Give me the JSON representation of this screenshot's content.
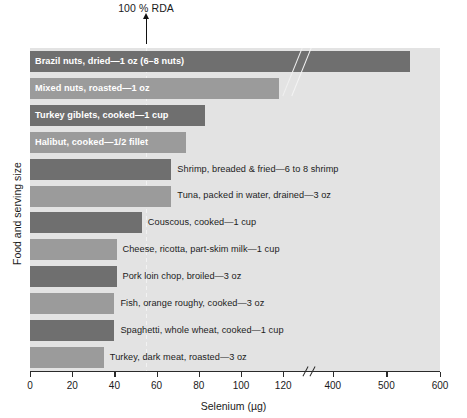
{
  "chart_data": {
    "type": "bar",
    "title": "",
    "xlabel": "Selenium (µg)",
    "ylabel": "Food and serving size",
    "orientation": "horizontal",
    "grid": false,
    "legend": "none",
    "axis_break": {
      "present": true,
      "between": [
        130,
        350
      ]
    },
    "xticks": [
      0,
      20,
      40,
      60,
      80,
      100,
      120,
      400,
      500,
      600
    ],
    "xtick_labels": [
      "0",
      "20",
      "40",
      "60",
      "80",
      "100",
      "120",
      "400",
      "500",
      "600"
    ],
    "xlim": [
      0,
      600
    ],
    "reference_line": {
      "label": "100 % RDA",
      "value": 55
    },
    "categories": [
      "Brazil nuts, dried—1 oz (6–8 nuts)",
      "Mixed nuts, roasted—1 oz",
      "Turkey giblets, cooked—1 cup",
      "Halibut, cooked—1/2 fillet",
      "Shrimp, breaded & fried—6 to 8 shrimp",
      "Tuna, packed in water, drained—3 oz",
      "Couscous, cooked—1 cup",
      "Cheese, ricotta, part-skim milk—1 cup",
      "Pork loin chop, broiled—3 oz",
      "Fish, orange roughy, cooked—3 oz",
      "Spaghetti, whole wheat, cooked—1 cup",
      "Turkey, dark meat, roasted—3 oz"
    ],
    "values": [
      544,
      118,
      83,
      74,
      67,
      67,
      53,
      41,
      41,
      40,
      40,
      35
    ]
  },
  "bars": [
    {
      "label": "Brazil nuts, dried—1 oz (6–8 nuts)",
      "value": 544,
      "shade": "dark",
      "label_position": "inside"
    },
    {
      "label": "Mixed nuts, roasted—1 oz",
      "value": 118,
      "shade": "light",
      "label_position": "inside"
    },
    {
      "label": "Turkey giblets, cooked—1 cup",
      "value": 83,
      "shade": "dark",
      "label_position": "inside"
    },
    {
      "label": "Halibut, cooked—1/2 fillet",
      "value": 74,
      "shade": "light",
      "label_position": "inside"
    },
    {
      "label": "Shrimp, breaded & fried—6 to 8 shrimp",
      "value": 67,
      "shade": "dark",
      "label_position": "outside"
    },
    {
      "label": "Tuna, packed in water, drained—3 oz",
      "value": 67,
      "shade": "light",
      "label_position": "outside"
    },
    {
      "label": "Couscous, cooked—1 cup",
      "value": 53,
      "shade": "dark",
      "label_position": "outside"
    },
    {
      "label": "Cheese, ricotta, part-skim milk—1 cup",
      "value": 41,
      "shade": "light",
      "label_position": "outside"
    },
    {
      "label": "Pork loin chop, broiled—3 oz",
      "value": 41,
      "shade": "dark",
      "label_position": "outside"
    },
    {
      "label": "Fish, orange roughy, cooked—3 oz",
      "value": 40,
      "shade": "light",
      "label_position": "outside"
    },
    {
      "label": "Spaghetti, whole wheat, cooked—1 cup",
      "value": 40,
      "shade": "dark",
      "label_position": "outside"
    },
    {
      "label": "Turkey, dark meat, roasted—3 oz",
      "value": 35,
      "shade": "light",
      "label_position": "outside"
    }
  ],
  "annotation": {
    "rda_text": "100 % RDA"
  },
  "axes": {
    "x_title": "Selenium (µg)",
    "y_title": "Food and serving size",
    "ticks": [
      "0",
      "20",
      "40",
      "60",
      "80",
      "100",
      "120",
      "400",
      "500",
      "600"
    ]
  },
  "colors": {
    "bar_dark": "#6f6f6f",
    "bar_light": "#9b9b9b",
    "plot_background": "#e3e3e3",
    "axis": "#2a2a2a",
    "inside_label": "#ffffff",
    "outside_label": "#1c1c1c"
  }
}
